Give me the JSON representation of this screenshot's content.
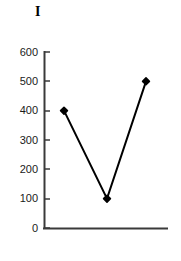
{
  "chart_data": {
    "type": "line",
    "title": "I",
    "xlabel": "",
    "ylabel": "",
    "x": [
      1,
      2,
      3
    ],
    "values": [
      400,
      100,
      500
    ],
    "categories": [
      "",
      "",
      ""
    ],
    "ylim": [
      0,
      600
    ],
    "yticks": [
      0,
      100,
      200,
      300,
      400,
      500,
      600
    ],
    "ytick_labels": [
      "0",
      "100",
      "200",
      "300",
      "400",
      "500",
      "600"
    ],
    "xticks": [],
    "xtick_labels": [],
    "grid": false,
    "legend": null,
    "series": [
      {
        "name": "",
        "values": [
          400,
          100,
          500
        ],
        "marker": "diamond",
        "marker_color": "#000000",
        "line_color": "#000000"
      }
    ]
  },
  "colors": {
    "line": "#000000",
    "marker": "#000000",
    "axis": "#3a3a3a",
    "text": "#1a1a1a",
    "background": "#ffffff"
  }
}
